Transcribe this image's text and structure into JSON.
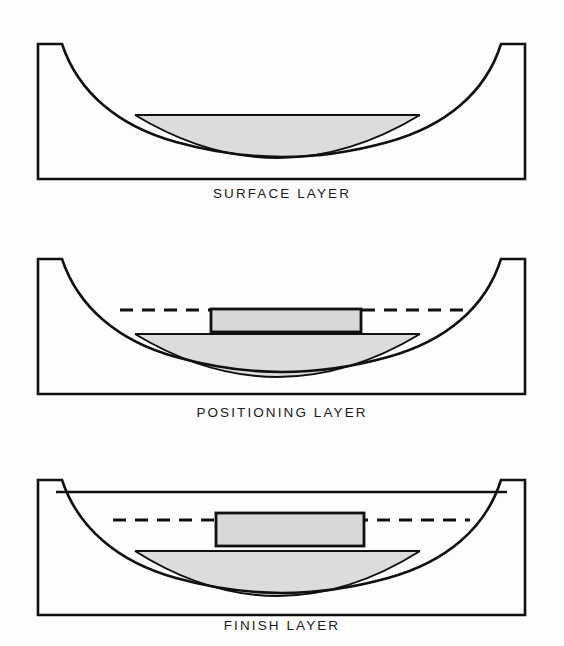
{
  "figure": {
    "panel_count": 3,
    "background_color": "#fdfdfd"
  },
  "style": {
    "stroke_color": "#101010",
    "outline_width": 2.6,
    "inner_line_width": 2.0,
    "liquid_fill_color": "#dcdcdc",
    "workpiece_fill_color": "#d8d8d8",
    "dash_pattern": "13 9",
    "dash_width": 3.0
  },
  "panels": [
    {
      "id": "surface-layer",
      "caption": "SURFACE LAYER",
      "basin": {
        "left_wall_x": 38,
        "right_wall_x": 525,
        "rim_y": 44,
        "floor_y": 179,
        "left_notch_x": 62,
        "right_notch_x": 501
      },
      "liquid": {
        "surface_y": 115,
        "surface_left_x": 135,
        "surface_right_x": 420,
        "bottom_apex_y": 158,
        "label": "surface layer coating"
      },
      "has_dashed_level_line": false,
      "has_workpiece": false,
      "has_fill_line": false
    },
    {
      "id": "positioning-layer",
      "caption": "POSITIONING LAYER",
      "basin": {
        "left_wall_x": 38,
        "right_wall_x": 525,
        "rim_y": 44,
        "floor_y": 179,
        "left_notch_x": 62,
        "right_notch_x": 501
      },
      "liquid": {
        "surface_y": 119,
        "surface_left_x": 135,
        "surface_right_x": 420,
        "bottom_apex_y": 162,
        "label": "positioning layer coating"
      },
      "dashed_level_line": {
        "y": 95,
        "left_x": 120,
        "right_x": 465,
        "label": "reference level"
      },
      "workpiece": {
        "left_x": 211,
        "right_x": 361,
        "top_y": 94,
        "bottom_y": 117,
        "label": "workpiece"
      },
      "has_dashed_level_line": true,
      "has_workpiece": true,
      "has_fill_line": false
    },
    {
      "id": "finish-layer",
      "caption": "FINISH LAYER",
      "basin": {
        "left_wall_x": 38,
        "right_wall_x": 525,
        "rim_y": 44,
        "floor_y": 179,
        "left_notch_x": 62,
        "right_notch_x": 501
      },
      "liquid": {
        "surface_y": 115,
        "surface_left_x": 135,
        "surface_right_x": 420,
        "bottom_apex_y": 160,
        "label": "finish layer coating"
      },
      "fill_line": {
        "y": 56,
        "left_x": 56,
        "right_x": 507,
        "label": "full bath level"
      },
      "dashed_level_line": {
        "y": 84,
        "left_x": 113,
        "right_x": 470,
        "label": "reference level"
      },
      "workpiece": {
        "left_x": 216,
        "right_x": 364,
        "top_y": 77,
        "bottom_y": 110,
        "label": "workpiece"
      },
      "has_dashed_level_line": true,
      "has_workpiece": true,
      "has_fill_line": true
    }
  ]
}
